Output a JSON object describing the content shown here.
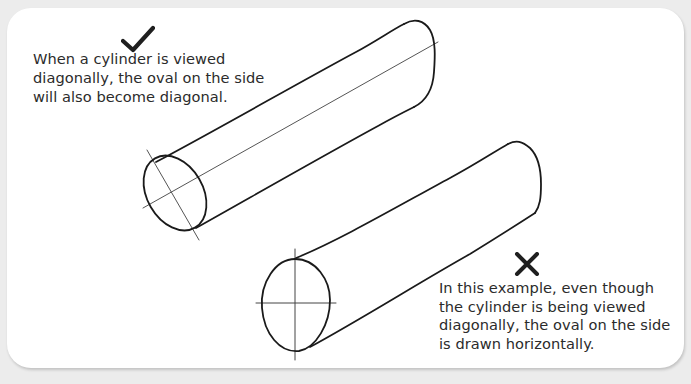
{
  "diagram": {
    "background_color": "#ececec",
    "card_color": "#ffffff",
    "ink_color": "#1a1a1a",
    "text_color": "#2b2b2b",
    "examples": [
      {
        "id": "correct",
        "icon": "checkmark-icon",
        "verdict": "correct",
        "caption_lines": [
          "When a cylinder is viewed",
          "diagonally, the oval on the side",
          "will also become diagonal."
        ],
        "drawing": "cylinder-diagonal-oval"
      },
      {
        "id": "incorrect",
        "icon": "cross-icon",
        "verdict": "incorrect",
        "caption_lines": [
          "In this example, even though",
          "the cylinder is being viewed",
          "diagonally, the oval on the side",
          "is drawn horizontally."
        ],
        "drawing": "cylinder-horizontal-oval"
      }
    ]
  }
}
